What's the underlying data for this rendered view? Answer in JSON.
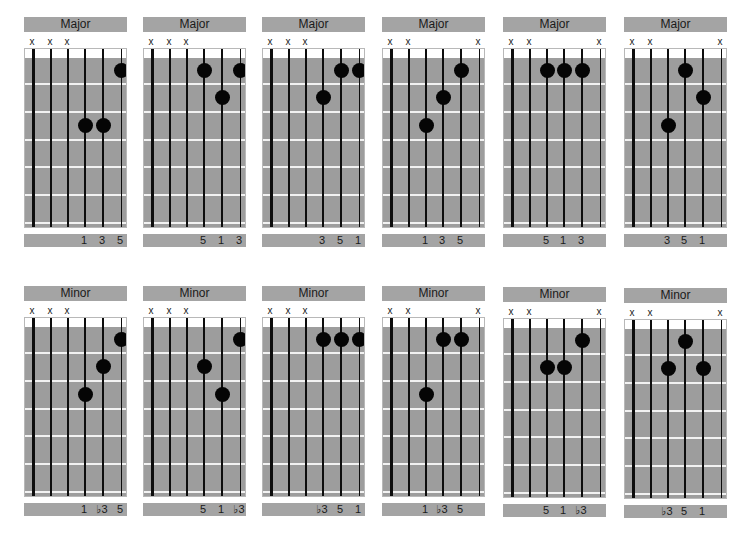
{
  "layout": {
    "columns_x": [
      24,
      143,
      262,
      382,
      503,
      624
    ],
    "rows_y": [
      17,
      286
    ],
    "row_extra_offset": [
      [
        0,
        0,
        0,
        0,
        0,
        0
      ],
      [
        0,
        0,
        0,
        0,
        1,
        2
      ]
    ],
    "string_x": [
      8,
      26,
      43,
      60,
      78,
      96
    ],
    "string_width": [
      3,
      2.5,
      2,
      1.6,
      1.2,
      1
    ],
    "fret_line_y": [
      25,
      53,
      81,
      108,
      136,
      164
    ],
    "fret_center_y": [
      12,
      39,
      67,
      94,
      122,
      150
    ],
    "colors": {
      "fretboard": "#9d9d9d",
      "label_bar": "#a4a4a4",
      "fret_line": "#f2f2f2",
      "string": "#0d0d0d",
      "dot": "#050505"
    }
  },
  "rows": [
    {
      "name": "major",
      "chords": [
        {
          "title": "Major",
          "mutes": [
            "x",
            "x",
            "x",
            "",
            "",
            ""
          ],
          "dots": [
            {
              "string": 4,
              "fret": 3
            },
            {
              "string": 5,
              "fret": 3
            },
            {
              "string": 6,
              "fret": 1
            }
          ],
          "degrees": [
            "",
            "",
            "",
            "1",
            "3",
            "5"
          ]
        },
        {
          "title": "Major",
          "mutes": [
            "x",
            "x",
            "x",
            "",
            "",
            ""
          ],
          "dots": [
            {
              "string": 4,
              "fret": 1
            },
            {
              "string": 5,
              "fret": 2
            },
            {
              "string": 6,
              "fret": 1
            }
          ],
          "degrees": [
            "",
            "",
            "",
            "5",
            "1",
            "3"
          ]
        },
        {
          "title": "Major",
          "mutes": [
            "x",
            "x",
            "x",
            "",
            "",
            ""
          ],
          "dots": [
            {
              "string": 4,
              "fret": 2
            },
            {
              "string": 5,
              "fret": 1
            },
            {
              "string": 6,
              "fret": 1
            }
          ],
          "degrees": [
            "",
            "",
            "",
            "3",
            "5",
            "1"
          ]
        },
        {
          "title": "Major",
          "mutes": [
            "x",
            "x",
            "",
            "",
            "",
            "x"
          ],
          "dots": [
            {
              "string": 3,
              "fret": 3
            },
            {
              "string": 4,
              "fret": 2
            },
            {
              "string": 5,
              "fret": 1
            }
          ],
          "degrees": [
            "",
            "",
            "1",
            "3",
            "5",
            ""
          ]
        },
        {
          "title": "Major",
          "mutes": [
            "x",
            "x",
            "",
            "",
            "",
            "x"
          ],
          "dots": [
            {
              "string": 3,
              "fret": 1
            },
            {
              "string": 4,
              "fret": 1
            },
            {
              "string": 5,
              "fret": 1
            }
          ],
          "degrees": [
            "",
            "",
            "5",
            "1",
            "3",
            ""
          ]
        },
        {
          "title": "Major",
          "mutes": [
            "x",
            "x",
            "",
            "",
            "",
            "x"
          ],
          "dots": [
            {
              "string": 3,
              "fret": 3
            },
            {
              "string": 4,
              "fret": 1
            },
            {
              "string": 5,
              "fret": 2
            }
          ],
          "degrees": [
            "",
            "",
            "3",
            "5",
            "1",
            ""
          ]
        }
      ]
    },
    {
      "name": "minor",
      "chords": [
        {
          "title": "Minor",
          "mutes": [
            "x",
            "x",
            "x",
            "",
            "",
            ""
          ],
          "dots": [
            {
              "string": 4,
              "fret": 3
            },
            {
              "string": 5,
              "fret": 2
            },
            {
              "string": 6,
              "fret": 1
            }
          ],
          "degrees": [
            "",
            "",
            "",
            "1",
            "♭3",
            "5"
          ]
        },
        {
          "title": "Minor",
          "mutes": [
            "x",
            "x",
            "x",
            "",
            "",
            ""
          ],
          "dots": [
            {
              "string": 4,
              "fret": 2
            },
            {
              "string": 5,
              "fret": 3
            },
            {
              "string": 6,
              "fret": 1
            }
          ],
          "degrees": [
            "",
            "",
            "",
            "5",
            "1",
            "♭3"
          ]
        },
        {
          "title": "Minor",
          "mutes": [
            "x",
            "x",
            "x",
            "",
            "",
            ""
          ],
          "dots": [
            {
              "string": 4,
              "fret": 1
            },
            {
              "string": 5,
              "fret": 1
            },
            {
              "string": 6,
              "fret": 1
            }
          ],
          "degrees": [
            "",
            "",
            "",
            "♭3",
            "5",
            "1"
          ]
        },
        {
          "title": "Minor",
          "mutes": [
            "x",
            "x",
            "",
            "",
            "",
            "x"
          ],
          "dots": [
            {
              "string": 3,
              "fret": 3
            },
            {
              "string": 4,
              "fret": 1
            },
            {
              "string": 5,
              "fret": 1
            }
          ],
          "degrees": [
            "",
            "",
            "1",
            "♭3",
            "5",
            ""
          ]
        },
        {
          "title": "Minor",
          "mutes": [
            "x",
            "x",
            "",
            "",
            "",
            "x"
          ],
          "dots": [
            {
              "string": 3,
              "fret": 2
            },
            {
              "string": 4,
              "fret": 2
            },
            {
              "string": 5,
              "fret": 1
            }
          ],
          "degrees": [
            "",
            "",
            "5",
            "1",
            "♭3",
            ""
          ]
        },
        {
          "title": "Minor",
          "mutes": [
            "x",
            "x",
            "",
            "",
            "",
            "x"
          ],
          "dots": [
            {
              "string": 3,
              "fret": 2
            },
            {
              "string": 4,
              "fret": 1
            },
            {
              "string": 5,
              "fret": 2
            }
          ],
          "degrees": [
            "",
            "",
            "♭3",
            "5",
            "1",
            ""
          ]
        }
      ]
    }
  ]
}
